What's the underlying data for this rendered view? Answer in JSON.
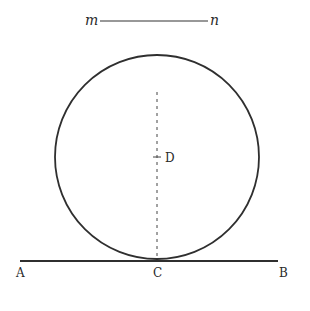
{
  "diagram": {
    "type": "geometry",
    "segment_mn": {
      "start_label": "m",
      "end_label": "n"
    },
    "circle": {
      "center_label": "D"
    },
    "tangent_line": {
      "left_label": "A",
      "tangent_point_label": "C",
      "right_label": "B"
    },
    "colors": {
      "ink": "#2a2a2a",
      "background": "#ffffff"
    }
  }
}
